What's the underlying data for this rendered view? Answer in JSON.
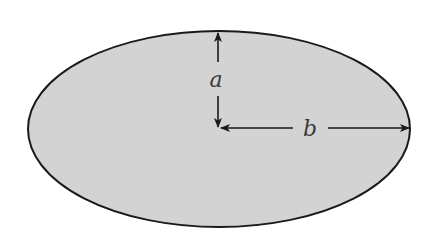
{
  "diagram": {
    "shape": "ellipse",
    "fill_color": "#d3d3d3",
    "stroke_color": "#1a1a1a",
    "background": "#ffffff",
    "center": {
      "x": 219,
      "y": 129
    },
    "rx": 191,
    "ry": 98,
    "labels": {
      "semi_minor": "a",
      "semi_major": "b"
    }
  }
}
